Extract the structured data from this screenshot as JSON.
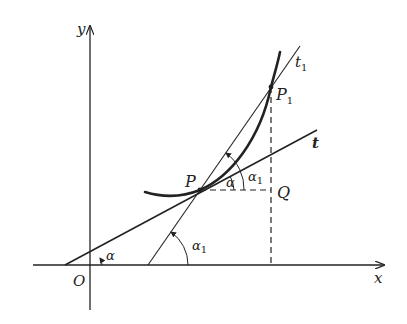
{
  "figure": {
    "axes": {
      "x_label": "x",
      "y_label": "y",
      "origin_label": "O"
    },
    "points": {
      "P": "P",
      "P1_base": "P",
      "P1_sub": "1",
      "Q": "Q"
    },
    "lines": {
      "t": "t",
      "t1_base": "t",
      "t1_sub": "1"
    },
    "angles": {
      "alpha": "α",
      "alpha1_base": "α",
      "alpha1_sub": "1"
    },
    "colors": {
      "ink": "#222222",
      "background": "#ffffff"
    }
  }
}
